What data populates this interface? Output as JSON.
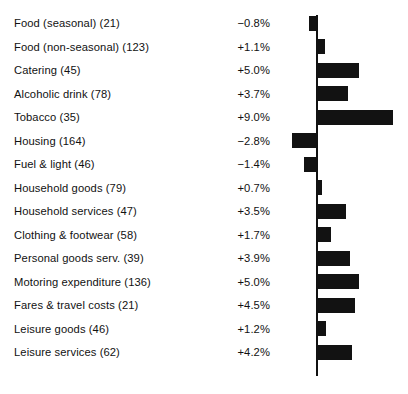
{
  "chart_data": {
    "type": "bar",
    "orientation": "horizontal",
    "title": "",
    "subtitle": "",
    "xlabel": "",
    "ylabel": "",
    "grid": false,
    "legend": null,
    "zero_axis": true,
    "value_suffix": "%",
    "xlim": [
      -3.0,
      9.5
    ],
    "categories": [
      "Food (seasonal) (21)",
      "Food (non-seasonal) (123)",
      "Catering (45)",
      "Alcoholic drink (78)",
      "Tobacco (35)",
      "Housing (164)",
      "Fuel & light (46)",
      "Household goods (79)",
      "Household services (47)",
      "Clothing & footwear (58)",
      "Personal goods serv. (39)",
      "Motoring expenditure (136)",
      "Fares & travel costs (21)",
      "Leisure goods (46)",
      "Leisure services (62)"
    ],
    "weights": [
      21,
      123,
      45,
      78,
      35,
      164,
      46,
      79,
      47,
      58,
      39,
      136,
      21,
      46,
      62
    ],
    "values": [
      -0.8,
      1.1,
      5.0,
      3.7,
      9.0,
      -2.8,
      -1.4,
      0.7,
      3.5,
      1.7,
      3.9,
      5.0,
      4.5,
      1.2,
      4.2
    ],
    "value_labels": [
      "−0.8%",
      "+1.1%",
      "+5.0%",
      "+3.7%",
      "+9.0%",
      "−2.8%",
      "−1.4%",
      "+0.7%",
      "+3.5%",
      "+1.7%",
      "+3.9%",
      "+5.0%",
      "+4.5%",
      "+1.2%",
      "+4.2%"
    ],
    "bar_color": "#121212",
    "axis_color": "#111111",
    "background_color": "#ffffff"
  },
  "layout": {
    "row_start_y": 11.5,
    "row_pitch": 23.5,
    "zero_x": 316,
    "px_per_percent": 8.6,
    "bar_height": 15,
    "axis_top": 15,
    "axis_bottom": 376
  }
}
